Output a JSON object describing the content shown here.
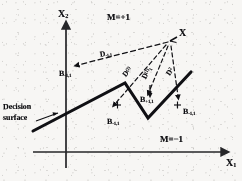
{
  "figure": {
    "kind": "decision-surface-diagram",
    "axes": {
      "y_label": "X",
      "y_label_sub": "2",
      "x_label": "X",
      "x_label_sub": "1"
    },
    "regions": [
      {
        "name": "upper-region",
        "label": "M=+1"
      },
      {
        "name": "lower-region",
        "label": "M=−1"
      }
    ],
    "annotations": {
      "surface_caption_line1": "Decision",
      "surface_caption_line2": "surface",
      "test_point": "X"
    },
    "distance_vectors": [
      {
        "name": "d-long-upper-left",
        "base": "D",
        "sub": "-1,1"
      },
      {
        "name": "d-mid-left",
        "base": "D",
        "sup": "(2)"
      },
      {
        "name": "d-mid-center",
        "base": "D",
        "sup": "(1)",
        "sub": "1"
      },
      {
        "name": "d-right",
        "base": "D",
        "sup": "2"
      }
    ],
    "boundary_points": [
      {
        "name": "b-upper-left",
        "base": "B",
        "sub": "-1,1"
      },
      {
        "name": "b-lower-left",
        "base": "B",
        "sub": "-1,1"
      },
      {
        "name": "b-center",
        "base": "B",
        "sub": "+1,1"
      },
      {
        "name": "b-lower-right",
        "base": "B",
        "sub": "-1,1"
      }
    ],
    "colors": {
      "ink": "#16161a",
      "paper": "#f3f2f0",
      "axis": "#2b2b2e"
    }
  }
}
